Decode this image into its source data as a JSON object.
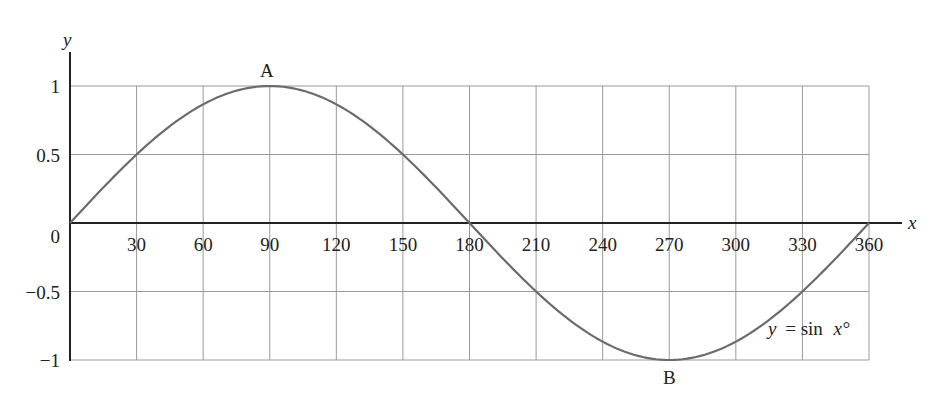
{
  "chart_data": {
    "type": "line",
    "title": "",
    "xlabel": "x",
    "ylabel": "y",
    "xlim": [
      0,
      360
    ],
    "ylim": [
      -1,
      1
    ],
    "grid": true,
    "x_ticks": [
      30,
      60,
      90,
      120,
      150,
      180,
      210,
      240,
      270,
      300,
      330,
      360
    ],
    "x_tick_labels": [
      "30",
      "60",
      "90",
      "120",
      "150",
      "180",
      "210",
      "240",
      "270",
      "300",
      "330",
      "360"
    ],
    "y_ticks": [
      1,
      0.5,
      0,
      -0.5,
      -1
    ],
    "y_tick_labels": [
      "1",
      "0.5",
      "0",
      "−0.5",
      "−1"
    ],
    "series": [
      {
        "name": "y = sin x°",
        "x": [
          0,
          30,
          60,
          90,
          120,
          150,
          180,
          210,
          240,
          270,
          300,
          330,
          360
        ],
        "values": [
          0,
          0.5,
          0.866,
          1,
          0.866,
          0.5,
          0,
          -0.5,
          -0.866,
          -1,
          -0.866,
          -0.5,
          0
        ]
      }
    ],
    "annotations": [
      {
        "text": "A",
        "x": 90,
        "y": 1
      },
      {
        "text": "B",
        "x": 270,
        "y": -1
      },
      {
        "text": "y = sin x°",
        "x": 315,
        "y": -0.8
      }
    ],
    "colors": {
      "curve": "#6b6b6b",
      "grid": "#9a9a9a",
      "axis": "#222222"
    }
  },
  "labels": {
    "x_axis": "x",
    "y_axis": "y",
    "point_a": "A",
    "point_b": "B",
    "curve_y": "y",
    "curve_eq": "= sin",
    "curve_x": "x°",
    "origin": "0"
  }
}
